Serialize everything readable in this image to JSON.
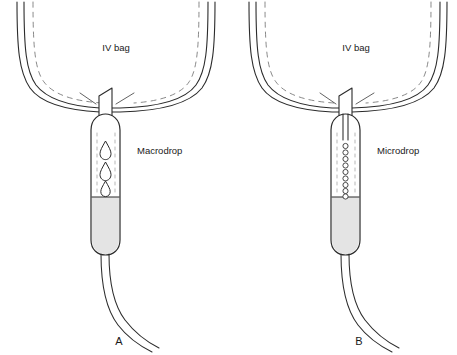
{
  "figure": {
    "background_color": "#ffffff",
    "ink_color": "#2b2b2b",
    "fluid_color": "#e4e4e4",
    "width": 457,
    "height": 355
  },
  "panels": [
    {
      "letter": "A",
      "bag_label": "IV bag",
      "chamber_label": "Macrodrop",
      "drop_type": "macrodrop",
      "drop_count": 3,
      "drop_shape": "teardrop",
      "spike_type": "wide-pointed-spike",
      "inlet_style": "wide tube"
    },
    {
      "letter": "B",
      "bag_label": "IV bag",
      "chamber_label": "Microdrop",
      "drop_type": "microdrop",
      "drop_count": 9,
      "drop_shape": "small-circle",
      "spike_type": "wide-pointed-spike",
      "inlet_style": "narrow needle tube"
    }
  ]
}
